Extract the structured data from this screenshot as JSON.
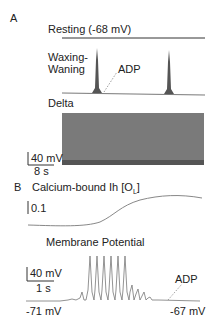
{
  "panel_a": {
    "label": "A",
    "resting": {
      "title": "Resting (-68 mV)"
    },
    "waxing": {
      "title_line1": "Waxing-",
      "title_line2": "Waning",
      "annotation": "ADP"
    },
    "delta": {
      "title": "Delta"
    },
    "scalebar": {
      "y_label": "40 mV",
      "x_label": "8 s"
    }
  },
  "panel_b": {
    "label": "B",
    "calcium": {
      "title": "Calcium-bound Ih [O",
      "subscript": "L",
      "title_end": "]",
      "scale_label": "0.1"
    },
    "membrane": {
      "title": "Membrane Potential",
      "scalebar": {
        "y_label": "40 mV",
        "x_label": "1 s"
      },
      "start_label": "-71 mV",
      "end_label": "-67 mV",
      "annotation": "ADP"
    }
  },
  "colors": {
    "trace": "#888888",
    "axis": "#333333",
    "dense": "#7a7a7a"
  }
}
